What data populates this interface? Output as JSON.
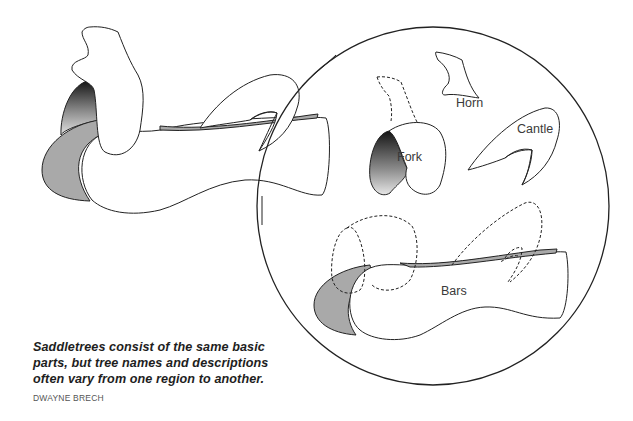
{
  "figure": {
    "labels": {
      "fork": "Fork",
      "horn": "Horn",
      "cantle": "Cantle",
      "bars": "Bars"
    },
    "colors": {
      "stroke": "#222222",
      "bar_fill": "#a9a9a9",
      "fork_gradient_top": "#1a1a1a",
      "fork_gradient_bottom": "#dcdcdc",
      "label": "#3a3a3a"
    }
  },
  "caption": {
    "lines": [
      "Saddletrees consist of the same basic",
      "parts, but tree names and descriptions",
      "often vary from one region to another."
    ],
    "credit": "DWAYNE BRECH"
  }
}
